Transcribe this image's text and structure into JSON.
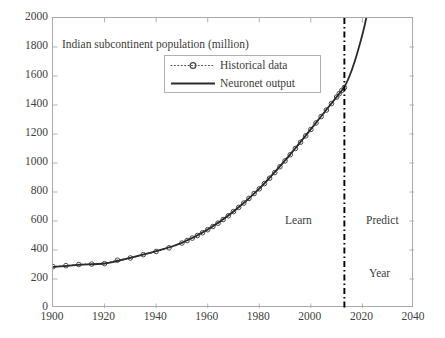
{
  "chart_data": {
    "type": "line",
    "title": "Indian subcontinent population (million)",
    "xlabel": "Year",
    "ylabel": "",
    "xlim": [
      1900,
      2040
    ],
    "ylim": [
      0,
      2000
    ],
    "xticks": [
      "1900",
      "1920",
      "1940",
      "1960",
      "1980",
      "2000",
      "2020",
      "2040"
    ],
    "yticks": [
      "0",
      "200",
      "400",
      "600",
      "800",
      "1000",
      "1200",
      "1400",
      "1600",
      "1800",
      "2000"
    ],
    "xtick_values": [
      1900,
      1920,
      1940,
      1960,
      1980,
      2000,
      2020,
      2040
    ],
    "ytick_values": [
      0,
      200,
      400,
      600,
      800,
      1000,
      1200,
      1400,
      1600,
      1800,
      2000
    ],
    "grid": false,
    "legend_position": "top-center",
    "legend": [
      {
        "label": "Historical data",
        "style": "dotted-line-with-circle-marker",
        "color": "#555555"
      },
      {
        "label": "Neuronet output",
        "style": "solid-line",
        "color": "#2b2b2b"
      }
    ],
    "annotations": [
      {
        "text": "Learn",
        "x": 1990,
        "y": 620
      },
      {
        "text": "Predict",
        "x": 2022,
        "y": 620
      },
      {
        "text": "Year",
        "x": 2023,
        "y": 255
      }
    ],
    "divider": {
      "x": 2013,
      "style": "dash-dot",
      "color": "#000000",
      "label_left": "Learn",
      "label_right": "Predict"
    },
    "series": [
      {
        "name": "Historical data",
        "marker": "circle",
        "linestyle": "dotted",
        "color": "#555555",
        "x": [
          1900,
          1905,
          1910,
          1915,
          1920,
          1925,
          1930,
          1935,
          1940,
          1945,
          1950,
          1952,
          1954,
          1956,
          1958,
          1960,
          1962,
          1964,
          1966,
          1968,
          1970,
          1972,
          1974,
          1976,
          1978,
          1980,
          1982,
          1984,
          1986,
          1988,
          1990,
          1992,
          1994,
          1996,
          1998,
          2000,
          2002,
          2004,
          2006,
          2008,
          2010,
          2011,
          2012,
          2013
        ],
        "y": [
          285,
          292,
          300,
          303,
          306,
          330,
          345,
          368,
          390,
          415,
          448,
          465,
          482,
          500,
          519,
          540,
          562,
          585,
          610,
          636,
          665,
          694,
          724,
          756,
          789,
          822,
          858,
          895,
          934,
          974,
          1015,
          1057,
          1100,
          1143,
          1187,
          1231,
          1276,
          1320,
          1365,
          1410,
          1455,
          1478,
          1500,
          1520
        ]
      },
      {
        "name": "Neuronet output",
        "marker": "none",
        "linestyle": "solid",
        "color": "#2b2b2b",
        "x": [
          1900,
          1910,
          1920,
          1930,
          1940,
          1950,
          1960,
          1970,
          1980,
          1990,
          2000,
          2010,
          2013,
          2015,
          2017,
          2019,
          2021,
          2023,
          2025,
          2026
        ],
        "y": [
          283,
          298,
          307,
          346,
          392,
          450,
          541,
          666,
          824,
          1018,
          1234,
          1456,
          1525,
          1600,
          1700,
          1820,
          1960,
          2150,
          2450,
          2700
        ]
      }
    ]
  },
  "axis": {
    "x_tick_labels": [
      "1900",
      "1920",
      "1940",
      "1960",
      "1980",
      "2000",
      "2020",
      "2040"
    ],
    "y_tick_labels": [
      "0",
      "200",
      "400",
      "600",
      "800",
      "1000",
      "1200",
      "1400",
      "1600",
      "1800",
      "2000"
    ]
  },
  "labels": {
    "title": "Indian subcontinent population (million)",
    "learn": "Learn",
    "predict": "Predict",
    "year": "Year"
  },
  "legend": {
    "historical": "Historical data",
    "neuronet": "Neuronet output"
  },
  "colors": {
    "axis": "#a9a9a9",
    "text": "#3b3b3b",
    "historical": "#555555",
    "neuronet": "#2b2b2b",
    "divider": "#000000",
    "background": "#ffffff"
  }
}
